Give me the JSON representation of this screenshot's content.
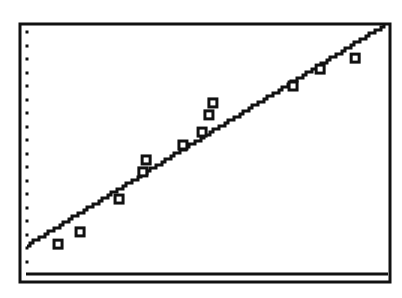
{
  "screen": {
    "background": "#ffffff",
    "ink": "#111111"
  },
  "chart_data": {
    "type": "scatter",
    "title": "",
    "xlabel": "",
    "ylabel": "",
    "grid": false,
    "legend": null,
    "axis_units": "normalized screen units (0-100), no tick labels shown",
    "xlim": [
      0,
      100
    ],
    "ylim": [
      0,
      100
    ],
    "y_axis_ticks": 18,
    "marker": "hollow-square",
    "series": [
      {
        "name": "data",
        "type": "scatter",
        "points": [
          {
            "x": 8.6,
            "y": 12.0
          },
          {
            "x": 14.7,
            "y": 16.9
          },
          {
            "x": 25.5,
            "y": 30.1
          },
          {
            "x": 32.1,
            "y": 41.0
          },
          {
            "x": 33.0,
            "y": 45.8
          },
          {
            "x": 43.2,
            "y": 51.8
          },
          {
            "x": 48.5,
            "y": 57.0
          },
          {
            "x": 50.4,
            "y": 63.9
          },
          {
            "x": 51.5,
            "y": 68.7
          },
          {
            "x": 73.7,
            "y": 75.5
          },
          {
            "x": 81.2,
            "y": 82.3
          },
          {
            "x": 90.9,
            "y": 86.7
          }
        ]
      },
      {
        "name": "regression line",
        "type": "line",
        "slope": 0.894,
        "intercept": 11.6,
        "x_range": [
          0,
          98.9
        ]
      }
    ]
  }
}
